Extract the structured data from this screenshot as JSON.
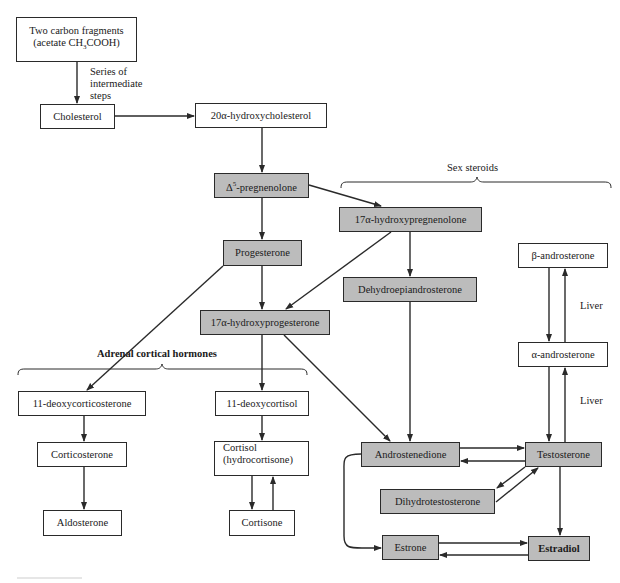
{
  "diagram": {
    "type": "flowchart",
    "colors": {
      "highlight_box": "#bcbcbc",
      "plain_box": "#ffffff",
      "line": "#2a2a2a"
    },
    "nodes": {
      "acetate": {
        "line1": "Two carbon fragments",
        "line2_prefix": "(acetate CH",
        "line2_sub": "3",
        "line2_suffix": "COOH)",
        "shaded": false
      },
      "cholesterol": {
        "label": "Cholesterol",
        "shaded": false
      },
      "hydroxycholesterol": {
        "label": "20α-hydroxycholesterol",
        "shaded": false
      },
      "pregnenolone": {
        "prefix": "Δ",
        "sup": "5",
        "suffix": "-pregnenolone",
        "shaded": true
      },
      "hydroxypregnenolone": {
        "label": "17α-hydroxypregnenolone",
        "shaded": true
      },
      "progesterone": {
        "label": "Progesterone",
        "shaded": true
      },
      "dhea": {
        "label": "Dehydroepiandrosterone",
        "shaded": true
      },
      "hydroxyprogesterone": {
        "label": "17α-hydroxyprogesterone",
        "shaded": true
      },
      "beta_androsterone": {
        "label": "β-androsterone",
        "shaded": false
      },
      "alpha_androsterone": {
        "label": "α-androsterone",
        "shaded": false
      },
      "deoxycorticosterone": {
        "label": "11-deoxycorticosterone",
        "shaded": false
      },
      "deoxycortisol": {
        "label": "11-deoxycortisol",
        "shaded": false
      },
      "corticosterone": {
        "label": "Corticosterone",
        "shaded": false
      },
      "cortisol": {
        "line1": "Cortisol",
        "line2": "(hydrocortisone)",
        "shaded": false
      },
      "aldosterone": {
        "label": "Aldosterone",
        "shaded": false
      },
      "cortisone": {
        "label": "Cortisone",
        "shaded": false
      },
      "androstenedione": {
        "label": "Androstenedione",
        "shaded": true
      },
      "testosterone": {
        "label": "Testosterone",
        "shaded": true
      },
      "dht": {
        "label": "Dihydrotestosterone",
        "shaded": true
      },
      "estrone": {
        "label": "Estrone",
        "shaded": true
      },
      "estradiol": {
        "label": "Estradiol",
        "shaded": true
      }
    },
    "annotations": {
      "intermediate_steps": {
        "line1": "Series of",
        "line2": "intermediate",
        "line3": "steps"
      },
      "liver_upper": "Liver",
      "liver_lower": "Liver"
    },
    "groups": {
      "sex_steroids": "Sex steroids",
      "adrenal_cortical": "Adrenal cortical hormones"
    },
    "edges": [
      [
        "acetate",
        "cholesterol"
      ],
      [
        "cholesterol",
        "hydroxycholesterol"
      ],
      [
        "hydroxycholesterol",
        "pregnenolone"
      ],
      [
        "pregnenolone",
        "hydroxypregnenolone"
      ],
      [
        "pregnenolone",
        "progesterone"
      ],
      [
        "progesterone",
        "hydroxyprogesterone"
      ],
      [
        "hydroxypregnenolone",
        "hydroxyprogesterone"
      ],
      [
        "hydroxypregnenolone",
        "dhea"
      ],
      [
        "progesterone",
        "deoxycorticosterone"
      ],
      [
        "hydroxyprogesterone",
        "deoxycortisol"
      ],
      [
        "hydroxyprogesterone",
        "androstenedione"
      ],
      [
        "dhea",
        "androstenedione"
      ],
      [
        "deoxycorticosterone",
        "corticosterone"
      ],
      [
        "corticosterone",
        "aldosterone"
      ],
      [
        "deoxycortisol",
        "cortisol"
      ],
      [
        "cortisol",
        "cortisone"
      ],
      [
        "cortisone",
        "cortisol"
      ],
      [
        "androstenedione",
        "testosterone"
      ],
      [
        "testosterone",
        "androstenedione"
      ],
      [
        "testosterone",
        "dht"
      ],
      [
        "dht",
        "testosterone"
      ],
      [
        "androstenedione",
        "estrone"
      ],
      [
        "testosterone",
        "estradiol"
      ],
      [
        "estrone",
        "estradiol"
      ],
      [
        "estradiol",
        "estrone"
      ],
      [
        "beta_androsterone",
        "alpha_androsterone"
      ],
      [
        "alpha_androsterone",
        "beta_androsterone"
      ],
      [
        "alpha_androsterone",
        "testosterone"
      ],
      [
        "testosterone",
        "alpha_androsterone"
      ]
    ]
  }
}
